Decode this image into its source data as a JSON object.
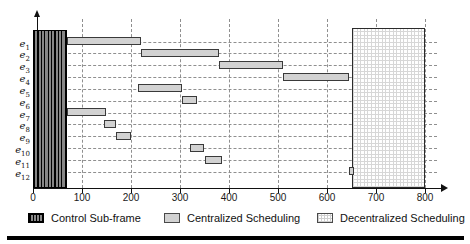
{
  "chart_data": {
    "type": "bar",
    "subtype": "gantt-interval-schedule",
    "title": "",
    "xlabel": "",
    "ylabel": "",
    "xlim": [
      0,
      860
    ],
    "x_ticks": [
      0,
      100,
      200,
      300,
      400,
      500,
      600,
      700,
      800
    ],
    "x_tick_labels": [
      "0",
      "100",
      "200",
      "300",
      "400",
      "500",
      "600",
      "700",
      "800"
    ],
    "grid": {
      "vertical_dashed_every": 100,
      "horizontal_dashed_per_row": true
    },
    "categories": [
      "e1",
      "e2",
      "e3",
      "e4",
      "e5",
      "e6",
      "e7",
      "e8",
      "e9",
      "e10",
      "e11",
      "e12"
    ],
    "series": [
      {
        "name": "Centralized Scheduling",
        "intervals": [
          {
            "row": "e1",
            "start": 70,
            "end": 220
          },
          {
            "row": "e2",
            "start": 220,
            "end": 380
          },
          {
            "row": "e3",
            "start": 380,
            "end": 510
          },
          {
            "row": "e4",
            "start": 510,
            "end": 645
          },
          {
            "row": "e5",
            "start": 215,
            "end": 305
          },
          {
            "row": "e6",
            "start": 305,
            "end": 335
          },
          {
            "row": "e7",
            "start": 70,
            "end": 150
          },
          {
            "row": "e8",
            "start": 145,
            "end": 170
          },
          {
            "row": "e9",
            "start": 170,
            "end": 200
          },
          {
            "row": "e10",
            "start": 320,
            "end": 350
          },
          {
            "row": "e11",
            "start": 350,
            "end": 385
          },
          {
            "row": "e12",
            "start": 645,
            "end": 655
          }
        ]
      }
    ],
    "blocks": [
      {
        "name": "Control Sub-frame",
        "start": 0,
        "end": 70,
        "rows": "all",
        "pattern": "dark-vertical-hatch"
      },
      {
        "name": "Decentralized Scheduling",
        "start": 650,
        "end": 800,
        "rows": "all",
        "pattern": "light-grid"
      }
    ],
    "legend_position": "bottom"
  },
  "legend": {
    "items": [
      {
        "label": "Control Sub-frame",
        "swatch": "dark-vertical-hatch"
      },
      {
        "label": "Centralized Scheduling",
        "swatch": "light-gray"
      },
      {
        "label": "Decentralized Scheduling",
        "swatch": "light-grid"
      }
    ]
  },
  "colors": {
    "bar_fill": "#d2d2d2",
    "bar_border": "#3a3a3a",
    "hatch_dark": "#868686",
    "hatch_line": "#000000",
    "grid_dash": "#8f8f8f",
    "axis": "#111111",
    "background": "#ffffff"
  }
}
